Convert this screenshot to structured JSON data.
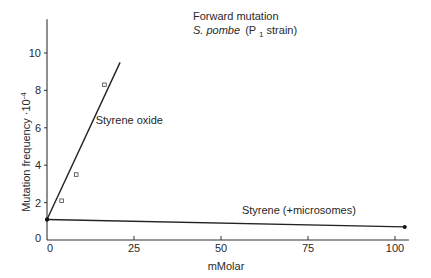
{
  "chart_data": {
    "type": "line",
    "title": "Forward mutation",
    "subtitle": "S. pombe (P1 strain)",
    "title_parts": {
      "line1": "Forward mutation",
      "organism": "S. pombe",
      "strain_open": "(P",
      "strain_sub": "1",
      "strain_close": " strain)"
    },
    "xlabel": "mMolar",
    "ylabel": "Mutation frequency ·10⁻⁴",
    "ylabel_parts": {
      "main": "Mutation frequency ·10",
      "exp": "-4"
    },
    "xlim": [
      0,
      104
    ],
    "ylim": [
      0,
      11.8
    ],
    "xticks": [
      0,
      25,
      50,
      75,
      100
    ],
    "yticks": [
      0,
      2,
      4,
      6,
      8,
      10
    ],
    "grid": false,
    "legend": "none (inline annotations)",
    "series": [
      {
        "name": "Styrene oxide",
        "marker": "open-square",
        "points": [
          {
            "x": 0,
            "y": 1.1
          },
          {
            "x": 4.2,
            "y": 2.1
          },
          {
            "x": 8.4,
            "y": 3.5
          },
          {
            "x": 16.5,
            "y": 8.3
          }
        ],
        "fit_line": [
          {
            "x": 0,
            "y": 1.1
          },
          {
            "x": 21,
            "y": 9.5
          }
        ]
      },
      {
        "name": "Styrene (+microsomes)",
        "marker": "filled-dot",
        "points": [
          {
            "x": 0,
            "y": 1.1
          },
          {
            "x": 102.8,
            "y": 0.7
          }
        ],
        "fit_line": [
          {
            "x": 0,
            "y": 1.1
          },
          {
            "x": 102.8,
            "y": 0.7
          }
        ]
      }
    ],
    "annotations": [
      {
        "text": "Styrene  oxide",
        "x": 14,
        "y": 6.2
      },
      {
        "text": "Styrene (+microsomes)",
        "x": 56,
        "y": 1.4
      }
    ]
  }
}
